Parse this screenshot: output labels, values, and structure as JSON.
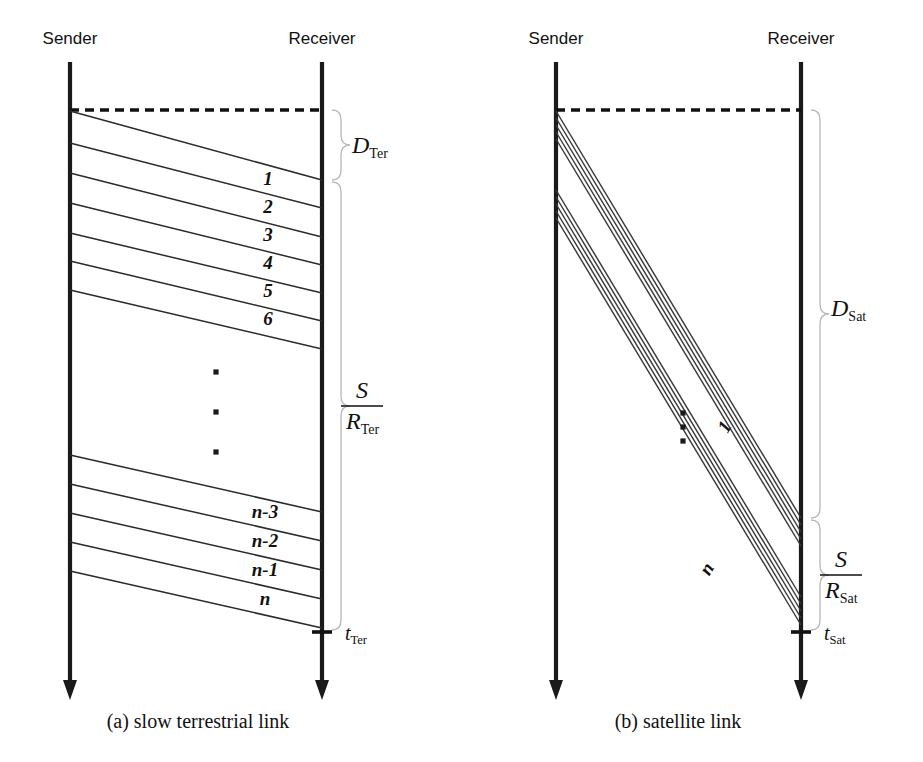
{
  "figure": {
    "background_color": "#ffffff",
    "ink_color": "#111111",
    "brace_color": "#b9b9b9"
  },
  "panels": [
    {
      "id": "terrestrial",
      "caption": "(a) slow terrestrial link",
      "caption_x": 198,
      "caption_y": 728,
      "sender": {
        "label": "Sender",
        "label_x": 70,
        "label_y": 44,
        "x": 70,
        "y_top": 62,
        "y_bottom": 700
      },
      "receiver": {
        "label": "Receiver",
        "label_x": 322,
        "label_y": 44,
        "x": 322,
        "y_top": 62,
        "y_bottom": 700
      },
      "dashed_reference": {
        "x1": 70,
        "y1": 110,
        "x2": 322,
        "y2": 110
      },
      "packet_lines": [
        {
          "label": "",
          "sender_y": 111,
          "receiver_y": 180
        },
        {
          "label": "1",
          "sender_y": 143,
          "receiver_y": 208,
          "label_x": 268,
          "label_y": 185
        },
        {
          "label": "2",
          "sender_y": 173,
          "receiver_y": 237,
          "label_x": 268,
          "label_y": 213
        },
        {
          "label": "3",
          "sender_y": 203,
          "receiver_y": 265,
          "label_x": 268,
          "label_y": 241
        },
        {
          "label": "4",
          "sender_y": 233,
          "receiver_y": 293,
          "label_x": 268,
          "label_y": 269
        },
        {
          "label": "5",
          "sender_y": 261,
          "receiver_y": 321,
          "label_x": 268,
          "label_y": 297
        },
        {
          "label": "6",
          "sender_y": 290,
          "receiver_y": 349,
          "label_x": 268,
          "label_y": 325
        },
        {
          "label": "",
          "sender_y": 455,
          "receiver_y": 512
        },
        {
          "label": "n-3",
          "sender_y": 484,
          "receiver_y": 541,
          "label_x": 265,
          "label_y": 518
        },
        {
          "label": "n-2",
          "sender_y": 513,
          "receiver_y": 570,
          "label_x": 265,
          "label_y": 547
        },
        {
          "label": "n-1",
          "sender_y": 542,
          "receiver_y": 599,
          "label_x": 265,
          "label_y": 576
        },
        {
          "label": "n",
          "sender_y": 571,
          "receiver_y": 628,
          "label_x": 265,
          "label_y": 605
        }
      ],
      "ellipsis_dots": [
        {
          "x": 216,
          "y": 372
        },
        {
          "x": 216,
          "y": 412
        },
        {
          "x": 216,
          "y": 452
        }
      ],
      "tick": {
        "x": 322,
        "y": 632,
        "half_width": 10
      },
      "tick_label": {
        "base": "t",
        "sub": "Ter",
        "x": 345,
        "y": 640
      },
      "braces": [
        {
          "name": "propagation-delay-brace",
          "x": 332,
          "y_top": 110,
          "y_bottom": 180,
          "label_type": "plain",
          "label": {
            "base": "D",
            "sub": "Ter",
            "x": 352,
            "y": 153
          }
        },
        {
          "name": "transmission-time-brace",
          "x": 332,
          "y_top": 182,
          "y_bottom": 630,
          "label_type": "fraction",
          "label": {
            "numerator": "S",
            "denominator_base": "R",
            "denominator_sub": "Ter",
            "x": 362,
            "y": 406
          }
        }
      ]
    },
    {
      "id": "satellite",
      "caption": "(b) satellite link",
      "caption_x": 678,
      "caption_y": 728,
      "sender": {
        "label": "Sender",
        "label_x": 556,
        "label_y": 44,
        "x": 556,
        "y_top": 62,
        "y_bottom": 700
      },
      "receiver": {
        "label": "Receiver",
        "label_x": 801,
        "label_y": 44,
        "x": 801,
        "y_top": 62,
        "y_bottom": 700
      },
      "dashed_reference": {
        "x1": 556,
        "y1": 110,
        "x2": 801,
        "y2": 110
      },
      "bundles": [
        {
          "name": "first-packet-bundle",
          "sender_y_start": 111,
          "receiver_y_start": 518,
          "line_count": 5,
          "offset_step": 7
        },
        {
          "name": "last-packet-bundle",
          "sender_y_start": 190,
          "receiver_y_start": 597,
          "line_count": 5,
          "offset_step": 7
        }
      ],
      "rotated_labels": [
        {
          "label": "1",
          "x": 730,
          "y": 430,
          "rotation": -59
        },
        {
          "label": "n",
          "x": 712,
          "y": 572,
          "rotation": -59
        }
      ],
      "ellipsis_dots": [
        {
          "x": 683,
          "y": 413
        },
        {
          "x": 683,
          "y": 427
        },
        {
          "x": 683,
          "y": 441
        }
      ],
      "tick": {
        "x": 801,
        "y": 632,
        "half_width": 10
      },
      "tick_label": {
        "base": "t",
        "sub": "Sat",
        "x": 824,
        "y": 640
      },
      "braces": [
        {
          "name": "propagation-delay-brace",
          "x": 811,
          "y_top": 110,
          "y_bottom": 518,
          "label_type": "plain",
          "label": {
            "base": "D",
            "sub": "Sat",
            "x": 831,
            "y": 316
          }
        },
        {
          "name": "transmission-time-brace",
          "x": 811,
          "y_top": 520,
          "y_bottom": 630,
          "label_type": "fraction",
          "label": {
            "numerator": "S",
            "denominator_base": "R",
            "denominator_sub": "Sat",
            "x": 841,
            "y": 575
          }
        }
      ]
    }
  ]
}
